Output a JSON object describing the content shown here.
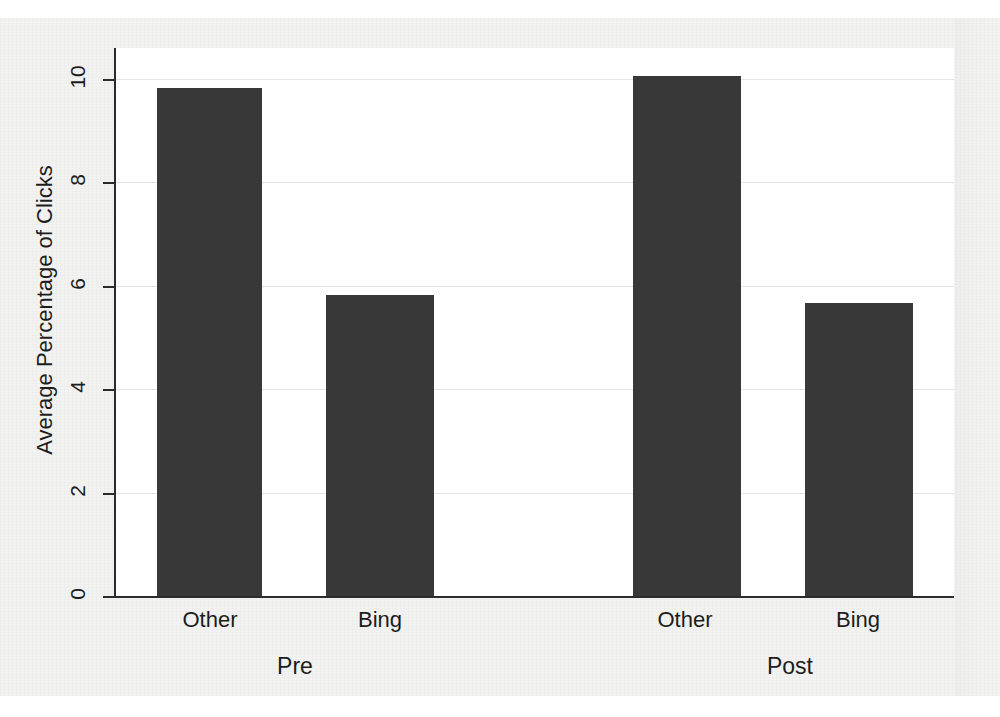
{
  "chart_data": {
    "type": "bar",
    "title": "",
    "subtitle": "",
    "xlabel": "",
    "ylabel": "Average Percentage of Clicks",
    "ylim": [
      0,
      10.6
    ],
    "yticks": [
      0,
      2,
      4,
      6,
      8,
      10
    ],
    "ytick_labels": [
      "0",
      "2",
      "4",
      "6",
      "8",
      "10"
    ],
    "grid": true,
    "grid_axis": "y",
    "legend": false,
    "legend_position": "none",
    "group_labels": [
      "Pre",
      "Post"
    ],
    "categories": [
      "Other",
      "Bing",
      "Other",
      "Bing"
    ],
    "groups": [
      {
        "name": "Pre",
        "bars": [
          {
            "category": "Other",
            "value": 9.85
          },
          {
            "category": "Bing",
            "value": 5.85
          }
        ]
      },
      {
        "name": "Post",
        "bars": [
          {
            "category": "Other",
            "value": 10.08
          },
          {
            "category": "Bing",
            "value": 5.68
          }
        ]
      }
    ],
    "values": [
      9.85,
      5.85,
      10.08,
      5.68
    ],
    "bar_color": "#383838",
    "background_color": "#f2f2f0",
    "plot_background_color": "#ffffff",
    "axis_color": "#2b2b2b",
    "grid_color": "#e4e4e4"
  },
  "axis": {
    "y_title": "Average Percentage of Clicks",
    "y_ticks": [
      {
        "label": "10",
        "value": 10
      },
      {
        "label": "8",
        "value": 8
      },
      {
        "label": "6",
        "value": 6
      },
      {
        "label": "4",
        "value": 4
      },
      {
        "label": "2",
        "value": 2
      },
      {
        "label": "0",
        "value": 0
      }
    ],
    "x_ticks": [
      {
        "label": "Other"
      },
      {
        "label": "Bing"
      },
      {
        "label": "Other"
      },
      {
        "label": "Bing"
      }
    ],
    "x_groups": [
      {
        "label": "Pre"
      },
      {
        "label": "Post"
      }
    ]
  }
}
